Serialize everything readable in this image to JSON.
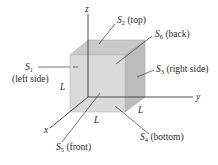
{
  "diagram": {
    "type": "cube-surfaces",
    "axes": {
      "x": {
        "label": "x"
      },
      "y": {
        "label": "y"
      },
      "z": {
        "label": "z"
      }
    },
    "edge_label": "L",
    "surfaces": [
      {
        "symbol": "S",
        "index": "1",
        "name": "(left side)"
      },
      {
        "symbol": "S",
        "index": "2",
        "name": "(top)"
      },
      {
        "symbol": "S",
        "index": "3",
        "name": "(right side)"
      },
      {
        "symbol": "S",
        "index": "4",
        "name": "(bottom)"
      },
      {
        "symbol": "S",
        "index": "5",
        "name": "(front)"
      },
      {
        "symbol": "S",
        "index": "6",
        "name": "(back)"
      }
    ],
    "colors": {
      "front_face": "#d9d9d9",
      "top_face": "#c8c8c8",
      "right_face": "#bdbdbd",
      "lines": "#3a3a3a"
    }
  }
}
